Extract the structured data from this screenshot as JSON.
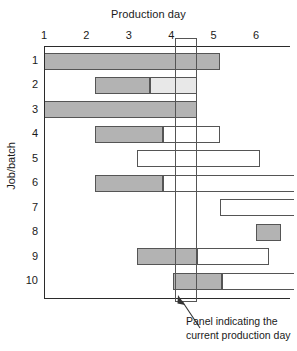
{
  "chart_data": {
    "type": "bar",
    "title": "",
    "xlabel": "Production day",
    "ylabel": "Job/batch",
    "xlim": [
      0.75,
      6.6
    ],
    "ylim": [
      0.5,
      10.5
    ],
    "grid": false,
    "legend": null,
    "x_ticks": [
      1,
      2,
      3,
      4,
      5,
      6
    ],
    "x_tick_labels": [
      "1",
      "2",
      "3",
      "4",
      "5",
      "6"
    ],
    "y_ticks": [
      1,
      2,
      3,
      4,
      5,
      6,
      7,
      8,
      9,
      10
    ],
    "y_tick_labels": [
      "1",
      "2",
      "3",
      "4",
      "5",
      "6",
      "7",
      "8",
      "9",
      "10"
    ],
    "categories": [
      "1",
      "2",
      "3",
      "4",
      "5",
      "6",
      "7",
      "8",
      "9",
      "10"
    ],
    "current_production_day": {
      "start": 4.1,
      "end": 4.6,
      "label": "Panel indicating the current production day"
    },
    "segment_styles": {
      "filled": "#b3b3b3",
      "light": "#e8e8e8",
      "empty": "#ffffff",
      "outline": "#555555"
    },
    "rows": [
      {
        "job": "1",
        "segments": [
          {
            "start": 1.0,
            "end": 5.15,
            "fill": "filled"
          }
        ]
      },
      {
        "job": "2",
        "segments": [
          {
            "start": 2.2,
            "end": 3.5,
            "fill": "filled"
          },
          {
            "start": 3.5,
            "end": 4.6,
            "fill": "light"
          }
        ]
      },
      {
        "job": "3",
        "segments": [
          {
            "start": 1.0,
            "end": 4.6,
            "fill": "filled"
          }
        ]
      },
      {
        "job": "4",
        "segments": [
          {
            "start": 2.2,
            "end": 3.8,
            "fill": "filled"
          },
          {
            "start": 3.8,
            "end": 5.15,
            "fill": "empty"
          }
        ]
      },
      {
        "job": "5",
        "segments": [
          {
            "start": 3.2,
            "end": 6.1,
            "fill": "empty"
          }
        ]
      },
      {
        "job": "6",
        "segments": [
          {
            "start": 2.2,
            "end": 3.8,
            "fill": "filled"
          },
          {
            "start": 3.8,
            "end": 6.9,
            "fill": "empty"
          }
        ]
      },
      {
        "job": "7",
        "segments": [
          {
            "start": 5.15,
            "end": 6.9,
            "fill": "empty"
          }
        ]
      },
      {
        "job": "8",
        "segments": [
          {
            "start": 6.0,
            "end": 6.6,
            "fill": "filled"
          }
        ]
      },
      {
        "job": "9",
        "segments": [
          {
            "start": 3.2,
            "end": 4.6,
            "fill": "filled"
          },
          {
            "start": 4.6,
            "end": 6.3,
            "fill": "empty"
          }
        ]
      },
      {
        "job": "10",
        "segments": [
          {
            "start": 4.05,
            "end": 5.2,
            "fill": "filled"
          },
          {
            "start": 5.2,
            "end": 6.9,
            "fill": "empty"
          }
        ]
      }
    ],
    "annotation": {
      "line1": "Panel indicating the",
      "line2": "current production day"
    }
  }
}
